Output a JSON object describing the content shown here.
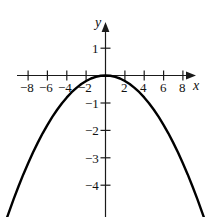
{
  "chart_data": {
    "type": "line",
    "title": "",
    "subtitle": "",
    "xlabel": "x",
    "ylabel": "y",
    "xlim": [
      -10.3,
      10.3
    ],
    "ylim": [
      -5.3,
      1.6
    ],
    "grid": false,
    "legend": null,
    "annotations": [],
    "series": [
      {
        "name": "parabola",
        "equation": "y = -0.05 x^2",
        "color": "#000000",
        "x": [
          -10.2,
          -9.5,
          -9,
          -8.5,
          -8,
          -7.5,
          -7,
          -6.5,
          -6,
          -5.5,
          -5,
          -4.5,
          -4,
          -3.5,
          -3,
          -2.5,
          -2,
          -1.5,
          -1,
          -0.5,
          0,
          0.5,
          1,
          1.5,
          2,
          2.5,
          3,
          3.5,
          4,
          4.5,
          5,
          5.5,
          6,
          6.5,
          7,
          7.5,
          8,
          8.5,
          9,
          9.5,
          10.2
        ],
        "y": [
          -5.2,
          -4.51,
          -4.05,
          -3.61,
          -3.2,
          -2.81,
          -2.45,
          -2.11,
          -1.8,
          -1.51,
          -1.25,
          -1.01,
          -0.8,
          -0.61,
          -0.45,
          -0.31,
          -0.2,
          -0.11,
          -0.05,
          -0.01,
          0,
          -0.01,
          -0.05,
          -0.11,
          -0.2,
          -0.31,
          -0.45,
          -0.61,
          -0.8,
          -1.01,
          -1.25,
          -1.51,
          -1.8,
          -2.11,
          -2.45,
          -2.81,
          -3.2,
          -3.61,
          -4.05,
          -4.51,
          -5.2
        ]
      }
    ],
    "x_ticks": [
      {
        "value": -8,
        "label": "−8"
      },
      {
        "value": -6,
        "label": "−6"
      },
      {
        "value": -4,
        "label": "−4"
      },
      {
        "value": -2,
        "label": "−2"
      },
      {
        "value": 2,
        "label": "2"
      },
      {
        "value": 4,
        "label": "4"
      },
      {
        "value": 6,
        "label": "6"
      },
      {
        "value": 8,
        "label": "8"
      }
    ],
    "y_ticks": [
      {
        "value": 1,
        "label": "1"
      },
      {
        "value": -1,
        "label": "−1"
      },
      {
        "value": -2,
        "label": "−2"
      },
      {
        "value": -3,
        "label": "−3"
      },
      {
        "value": -4,
        "label": "−4"
      }
    ],
    "x_tick_minor": [
      -10,
      -9,
      -7,
      -5,
      -3,
      -1,
      1,
      3,
      5,
      7,
      9
    ],
    "axes": {
      "x_axis_arrow": true,
      "y_axis_arrow": true,
      "origin_label": "",
      "axis_color": "#1a1a1a",
      "curve_color": "#000000",
      "background": "#ffffff"
    }
  }
}
